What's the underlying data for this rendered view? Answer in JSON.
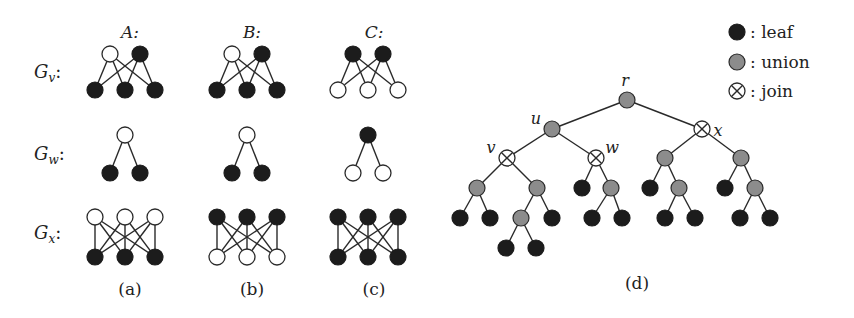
{
  "figure": {
    "columns": [
      {
        "key": "A",
        "label": "A:",
        "caption": "(a)"
      },
      {
        "key": "B",
        "label": "B:",
        "caption": "(b)"
      },
      {
        "key": "C",
        "label": "C:",
        "caption": "(c)"
      }
    ],
    "rows": [
      {
        "key": "Gv",
        "label": "G",
        "sub": "v",
        "suffix": ":"
      },
      {
        "key": "Gw",
        "label": "G",
        "sub": "w",
        "suffix": ":"
      },
      {
        "key": "Gx",
        "label": "G",
        "sub": "x",
        "suffix": ":"
      }
    ],
    "graphs": {
      "A": {
        "Gv": {
          "top": [
            "empty",
            "leaf"
          ],
          "bottom": [
            "leaf",
            "leaf",
            "leaf"
          ]
        },
        "Gw": {
          "top": [
            "empty"
          ],
          "bottom": [
            "leaf",
            "leaf"
          ]
        },
        "Gx": {
          "top": [
            "empty",
            "empty",
            "empty"
          ],
          "bottom": [
            "leaf",
            "leaf",
            "leaf"
          ]
        }
      },
      "B": {
        "Gv": {
          "top": [
            "empty",
            "leaf"
          ],
          "bottom": [
            "leaf",
            "leaf",
            "leaf"
          ]
        },
        "Gw": {
          "top": [
            "empty"
          ],
          "bottom": [
            "leaf",
            "leaf"
          ]
        },
        "Gx": {
          "top": [
            "leaf",
            "leaf",
            "leaf"
          ],
          "bottom": [
            "empty",
            "empty",
            "empty"
          ]
        }
      },
      "C": {
        "Gv": {
          "top": [
            "leaf",
            "leaf"
          ],
          "bottom": [
            "empty",
            "empty",
            "empty"
          ]
        },
        "Gw": {
          "top": [
            "leaf"
          ],
          "bottom": [
            "empty",
            "empty"
          ]
        },
        "Gx": {
          "top": [
            "leaf",
            "leaf",
            "leaf"
          ],
          "bottom": [
            "leaf",
            "leaf",
            "leaf"
          ]
        }
      }
    },
    "tree": {
      "caption": "(d)",
      "labels": {
        "r": "r",
        "u": "u",
        "v": "v",
        "w": "w",
        "x": "x"
      },
      "nodes": [
        {
          "id": "r",
          "type": "union",
          "x": 627,
          "y": 100
        },
        {
          "id": "u",
          "type": "union",
          "x": 552,
          "y": 129
        },
        {
          "id": "x",
          "type": "join",
          "x": 702,
          "y": 129
        },
        {
          "id": "v",
          "type": "join",
          "x": 507,
          "y": 158
        },
        {
          "id": "w",
          "type": "join",
          "x": 596,
          "y": 158
        },
        {
          "id": "x1",
          "type": "union",
          "x": 665,
          "y": 158
        },
        {
          "id": "x2",
          "type": "union",
          "x": 741,
          "y": 158
        },
        {
          "id": "v1",
          "type": "union",
          "x": 477,
          "y": 188
        },
        {
          "id": "v2",
          "type": "union",
          "x": 537,
          "y": 188
        },
        {
          "id": "w1",
          "type": "leaf",
          "x": 582,
          "y": 188
        },
        {
          "id": "w2",
          "type": "union",
          "x": 611,
          "y": 188
        },
        {
          "id": "x1a",
          "type": "leaf",
          "x": 650,
          "y": 188
        },
        {
          "id": "x1b",
          "type": "union",
          "x": 679,
          "y": 188
        },
        {
          "id": "x2a",
          "type": "leaf",
          "x": 725,
          "y": 188
        },
        {
          "id": "x2b",
          "type": "union",
          "x": 755,
          "y": 188
        },
        {
          "id": "v1a",
          "type": "leaf",
          "x": 460,
          "y": 218
        },
        {
          "id": "v1b",
          "type": "leaf",
          "x": 490,
          "y": 218
        },
        {
          "id": "v2a",
          "type": "union",
          "x": 521,
          "y": 218
        },
        {
          "id": "v2b",
          "type": "leaf",
          "x": 552,
          "y": 218
        },
        {
          "id": "w2a",
          "type": "leaf",
          "x": 592,
          "y": 218
        },
        {
          "id": "w2b",
          "type": "leaf",
          "x": 622,
          "y": 218
        },
        {
          "id": "x1ba",
          "type": "leaf",
          "x": 665,
          "y": 218
        },
        {
          "id": "x1bb",
          "type": "leaf",
          "x": 695,
          "y": 218
        },
        {
          "id": "x2ba",
          "type": "leaf",
          "x": 740,
          "y": 218
        },
        {
          "id": "x2bb",
          "type": "leaf",
          "x": 770,
          "y": 218
        },
        {
          "id": "v2aa",
          "type": "leaf",
          "x": 506,
          "y": 248
        },
        {
          "id": "v2ab",
          "type": "leaf",
          "x": 536,
          "y": 248
        }
      ],
      "edges": [
        [
          "r",
          "u"
        ],
        [
          "r",
          "x"
        ],
        [
          "u",
          "v"
        ],
        [
          "u",
          "w"
        ],
        [
          "x",
          "x1"
        ],
        [
          "x",
          "x2"
        ],
        [
          "v",
          "v1"
        ],
        [
          "v",
          "v2"
        ],
        [
          "w",
          "w1"
        ],
        [
          "w",
          "w2"
        ],
        [
          "x1",
          "x1a"
        ],
        [
          "x1",
          "x1b"
        ],
        [
          "x2",
          "x2a"
        ],
        [
          "x2",
          "x2b"
        ],
        [
          "v1",
          "v1a"
        ],
        [
          "v1",
          "v1b"
        ],
        [
          "v2",
          "v2a"
        ],
        [
          "v2",
          "v2b"
        ],
        [
          "w2",
          "w2a"
        ],
        [
          "w2",
          "w2b"
        ],
        [
          "x1b",
          "x1ba"
        ],
        [
          "x1b",
          "x1bb"
        ],
        [
          "x2b",
          "x2ba"
        ],
        [
          "x2b",
          "x2bb"
        ],
        [
          "v2a",
          "v2aa"
        ],
        [
          "v2a",
          "v2ab"
        ]
      ]
    },
    "legend": [
      {
        "type": "leaf",
        "label": ": leaf"
      },
      {
        "type": "union",
        "label": ": union"
      },
      {
        "type": "join",
        "label": ": join"
      }
    ],
    "colors": {
      "leaf": "#1c1c1c",
      "union": "#8c8c8c",
      "empty": "#ffffff",
      "edge": "#2a2a2a"
    }
  }
}
